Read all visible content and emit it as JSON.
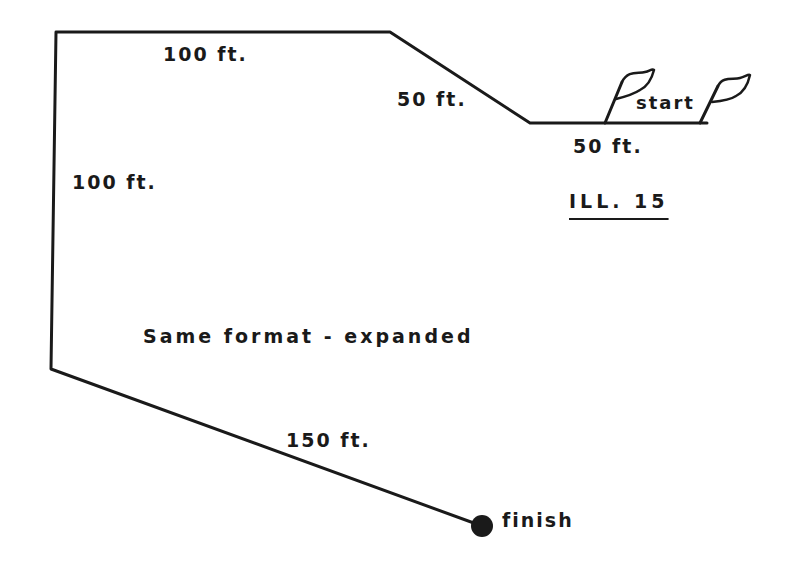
{
  "figure": {
    "id_label": "ILL. 15",
    "caption": "Same format - expanded",
    "start_label": "start",
    "finish_label": "finish",
    "colors": {
      "ink": "#1a1a1a",
      "background": "#ffffff"
    }
  },
  "segments": [
    {
      "name": "top-left-segment",
      "label": "100 ft.",
      "from": [
        56,
        32
      ],
      "to": [
        390,
        32
      ]
    },
    {
      "name": "top-diagonal-segment",
      "label": "50 ft.",
      "from": [
        390,
        32
      ],
      "to": [
        530,
        123
      ]
    },
    {
      "name": "start-segment",
      "label": "50 ft.",
      "from": [
        530,
        123
      ],
      "to": [
        707,
        123
      ]
    },
    {
      "name": "left-vertical-segment",
      "label": "100 ft.",
      "from": [
        56,
        32
      ],
      "to": [
        51,
        369
      ]
    },
    {
      "name": "bottom-diagonal-segment",
      "label": "150 ft.",
      "from": [
        51,
        369
      ],
      "to": [
        482,
        526
      ]
    }
  ],
  "labels": {
    "top_100": "100 ft.",
    "diag_50": "50 ft.",
    "start_50": "50 ft.",
    "left_100": "100 ft.",
    "bottom_150": "150 ft."
  }
}
